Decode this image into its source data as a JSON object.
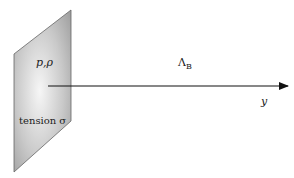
{
  "diagram": {
    "plate": {
      "label_top": "p,ρ",
      "label_bottom": "tension σ"
    },
    "axis": {
      "label": "y",
      "wave_label_main": "Λ",
      "wave_label_sub": "B"
    },
    "colors": {
      "plate_light": "#f4f4f4",
      "plate_dark": "#9a9a9a",
      "outline": "#555555",
      "arrow": "#111111"
    }
  }
}
